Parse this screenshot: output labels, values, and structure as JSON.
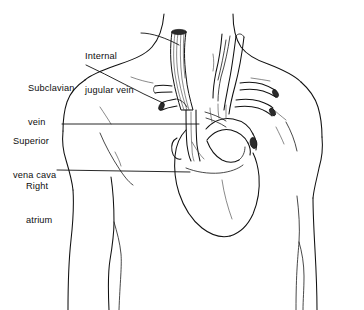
{
  "figure": {
    "view": "anterior",
    "style": "black-and-white line drawing",
    "background_color": "#ffffff",
    "line_color": "#111111",
    "text_color": "#0d0d0d",
    "width": 364,
    "height": 310
  },
  "labels": [
    {
      "id": "internal-jugular-vein",
      "lines": [
        "Internal",
        "jugular vein"
      ],
      "line1": "Internal",
      "line2": "jugular vein",
      "full_text": "Internal jugular vein",
      "text_x": 85,
      "text_y": 28,
      "leader_from_x": 141,
      "leader_from_y": 33,
      "leader_to_x": 179,
      "leader_to_y": 45
    },
    {
      "id": "subclavian-vein",
      "lines": [
        "Subclavian",
        "vein"
      ],
      "line1": "Subclavian",
      "line2": "vein",
      "full_text": "Subclavian vein",
      "text_x": 28,
      "text_y": 60,
      "leader_from_x": 86,
      "leader_from_y": 65,
      "leader_to_x": 163,
      "leader_to_y": 103
    },
    {
      "id": "superior-vena-cava",
      "lines": [
        "Superior",
        "vena cava"
      ],
      "line1": "Superior",
      "line2": "vena cava",
      "full_text": "Superior vena cava",
      "text_x": 13,
      "text_y": 113,
      "leader_from_x": 62,
      "leader_from_y": 124,
      "leader_to_x": 199,
      "leader_to_y": 124
    },
    {
      "id": "right-atrium",
      "lines": [
        "Right",
        "atrium"
      ],
      "line1": "Right",
      "line2": "atrium",
      "full_text": "Right atrium",
      "text_x": 26,
      "text_y": 158,
      "leader_from_x": 57,
      "leader_from_y": 170,
      "leader_to_x": 190,
      "leader_to_y": 172
    }
  ],
  "structures": [
    {
      "id": "torso-outline",
      "name": "Torso and neck outline"
    },
    {
      "id": "left-shoulder",
      "name": "Left shoulder and deltoid"
    },
    {
      "id": "right-shoulder",
      "name": "Right shoulder and deltoid"
    },
    {
      "id": "left-arm",
      "name": "Left upper arm"
    },
    {
      "id": "right-arm",
      "name": "Right upper arm"
    },
    {
      "id": "heart",
      "name": "Heart"
    },
    {
      "id": "internal-jugular-vein-vessel",
      "name": "Internal jugular vein"
    },
    {
      "id": "subclavian-vein-vessel",
      "name": "Subclavian vein"
    },
    {
      "id": "superior-vena-cava-vessel",
      "name": "Superior vena cava"
    },
    {
      "id": "right-atrium-chamber",
      "name": "Right atrium"
    },
    {
      "id": "aortic-arch",
      "name": "Aortic arch"
    },
    {
      "id": "brachiocephalic-vessels",
      "name": "Brachiocephalic and carotid vessels"
    },
    {
      "id": "sternocleidomastoid",
      "name": "Sternocleidomastoid muscle"
    }
  ]
}
